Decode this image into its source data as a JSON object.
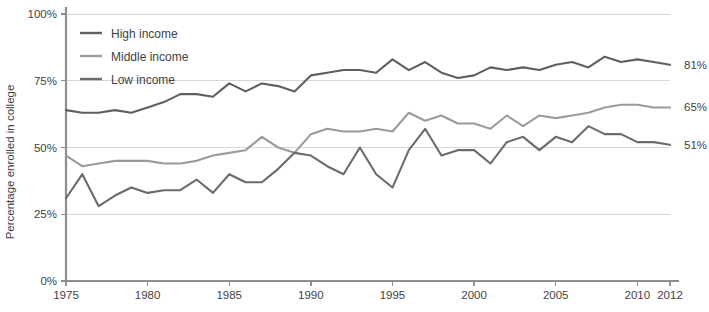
{
  "chart_data": {
    "type": "line",
    "title": "",
    "xlabel": "",
    "ylabel": "Percentage enrolled in college",
    "xlim": [
      1975,
      2012
    ],
    "ylim": [
      0,
      100
    ],
    "grid": true,
    "legend_position": "top-left",
    "y_ticks": [
      "0%",
      "25%",
      "50%",
      "75%",
      "100%"
    ],
    "y_tick_values": [
      0,
      25,
      50,
      75,
      100
    ],
    "x_ticks": [
      "1975",
      "1980",
      "1985",
      "1990",
      "1995",
      "2000",
      "2005",
      "2010",
      "2012"
    ],
    "x_tick_values": [
      1975,
      1980,
      1985,
      1990,
      1995,
      2000,
      2005,
      2010,
      2012
    ],
    "x": [
      1975,
      1976,
      1977,
      1978,
      1979,
      1980,
      1981,
      1982,
      1983,
      1984,
      1985,
      1986,
      1987,
      1988,
      1989,
      1990,
      1991,
      1992,
      1993,
      1994,
      1995,
      1996,
      1997,
      1998,
      1999,
      2000,
      2001,
      2002,
      2003,
      2004,
      2005,
      2006,
      2007,
      2008,
      2009,
      2010,
      2011,
      2012
    ],
    "series": [
      {
        "name": "High income",
        "color": "#5f5f5f",
        "end_label": "81%",
        "values": [
          64,
          63,
          63,
          64,
          63,
          65,
          67,
          70,
          70,
          69,
          74,
          71,
          74,
          73,
          71,
          77,
          78,
          79,
          79,
          78,
          83,
          79,
          82,
          78,
          76,
          77,
          80,
          79,
          80,
          79,
          81,
          82,
          80,
          84,
          82,
          83,
          82,
          81
        ]
      },
      {
        "name": "Middle income",
        "color": "#9b9b9b",
        "end_label": "65%",
        "values": [
          47,
          43,
          44,
          45,
          45,
          45,
          44,
          44,
          45,
          47,
          48,
          49,
          54,
          50,
          48,
          55,
          57,
          56,
          56,
          57,
          56,
          63,
          60,
          62,
          59,
          59,
          57,
          62,
          58,
          62,
          61,
          62,
          63,
          65,
          66,
          66,
          65,
          65
        ]
      },
      {
        "name": "Low income",
        "color": "#6b6b6b",
        "end_label": "51%",
        "values": [
          31,
          40,
          28,
          32,
          35,
          33,
          34,
          34,
          38,
          33,
          40,
          37,
          37,
          42,
          48,
          47,
          43,
          40,
          50,
          40,
          35,
          49,
          57,
          47,
          49,
          49,
          44,
          52,
          54,
          49,
          54,
          52,
          58,
          55,
          55,
          52,
          52,
          51
        ]
      }
    ]
  },
  "legend": {
    "items": [
      {
        "label": "High income"
      },
      {
        "label": "Middle income"
      },
      {
        "label": "Low income"
      }
    ]
  },
  "axes": {
    "y_title": "Percentage enrolled in college"
  },
  "colors": {
    "high_income": "#5f5f5f",
    "middle_income": "#9b9b9b",
    "low_income": "#6b6b6b",
    "axis": "#8d8d8d",
    "grid": "#d7d7d7",
    "text": "#3f3f3f",
    "background": "#ffffff"
  }
}
